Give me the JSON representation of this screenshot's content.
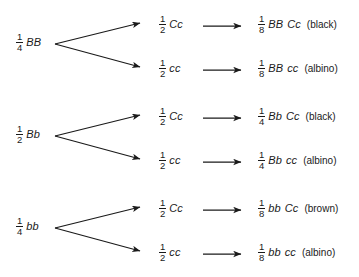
{
  "diagram": {
    "background_color": "#ffffff",
    "line_color": "#1a1a1a",
    "groups": [
      {
        "parent": {
          "num": "1",
          "den": "4",
          "genotype": "BB"
        },
        "branches": [
          {
            "gamete": {
              "num": "1",
              "den": "2",
              "genotype": "Cc"
            },
            "outcome": {
              "num": "1",
              "den": "8",
              "genotype_left": "BB",
              "genotype_right": "Cc",
              "phenotype": "(black)"
            }
          },
          {
            "gamete": {
              "num": "1",
              "den": "2",
              "genotype": "cc"
            },
            "outcome": {
              "num": "1",
              "den": "8",
              "genotype_left": "BB",
              "genotype_right": "cc",
              "phenotype": "(albino)"
            }
          }
        ]
      },
      {
        "parent": {
          "num": "1",
          "den": "2",
          "genotype": "Bb"
        },
        "branches": [
          {
            "gamete": {
              "num": "1",
              "den": "2",
              "genotype": "Cc"
            },
            "outcome": {
              "num": "1",
              "den": "4",
              "genotype_left": "Bb",
              "genotype_right": "Cc",
              "phenotype": "(black)"
            }
          },
          {
            "gamete": {
              "num": "1",
              "den": "2",
              "genotype": "cc"
            },
            "outcome": {
              "num": "1",
              "den": "4",
              "genotype_left": "Bb",
              "genotype_right": "cc",
              "phenotype": "(albino)"
            }
          }
        ]
      },
      {
        "parent": {
          "num": "1",
          "den": "4",
          "genotype": "bb"
        },
        "branches": [
          {
            "gamete": {
              "num": "1",
              "den": "2",
              "genotype": "Cc"
            },
            "outcome": {
              "num": "1",
              "den": "8",
              "genotype_left": "bb",
              "genotype_right": "Cc",
              "phenotype": "(brown)"
            }
          },
          {
            "gamete": {
              "num": "1",
              "den": "2",
              "genotype": "cc"
            },
            "outcome": {
              "num": "1",
              "den": "8",
              "genotype_left": "bb",
              "genotype_right": "cc",
              "phenotype": "(albino)"
            }
          }
        ]
      }
    ]
  }
}
